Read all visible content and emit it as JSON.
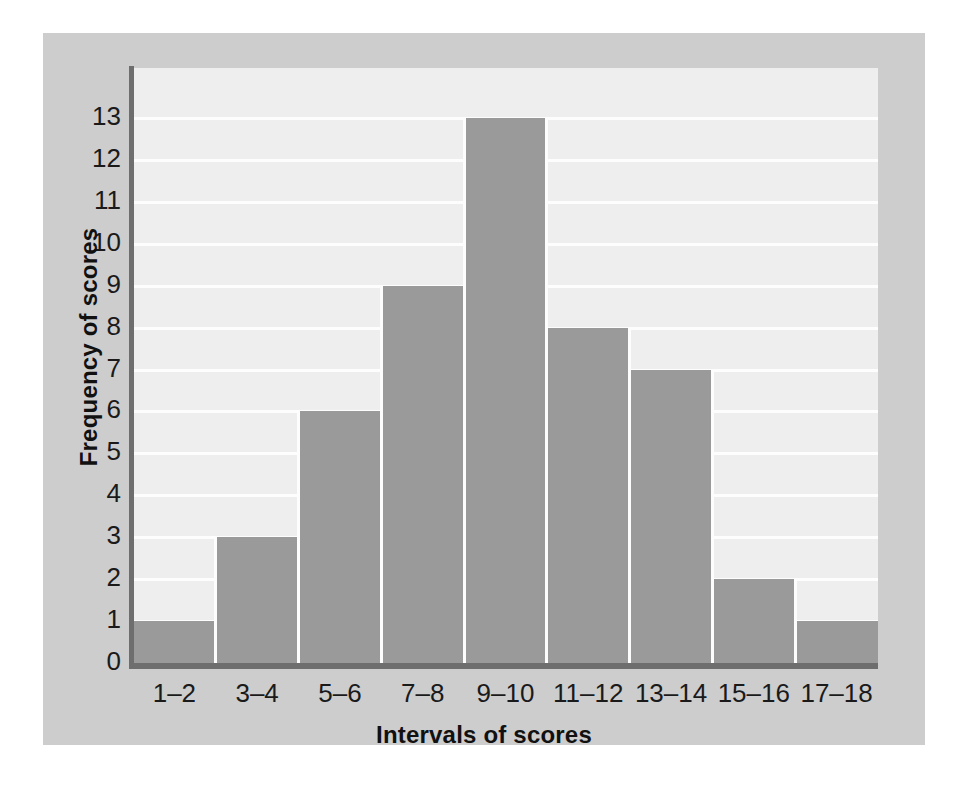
{
  "chart_data": {
    "type": "bar",
    "title": "",
    "subtitle": "",
    "xlabel": "Intervals of scores",
    "ylabel": "Frequency of scores",
    "categories": [
      "1–2",
      "3–4",
      "5–6",
      "7–8",
      "9–10",
      "11–12",
      "13–14",
      "15–16",
      "17–18"
    ],
    "values": [
      1,
      3,
      6,
      9,
      13,
      8,
      7,
      2,
      1
    ],
    "ylim": [
      0,
      13
    ],
    "yticks": [
      0,
      1,
      2,
      3,
      4,
      5,
      6,
      7,
      8,
      9,
      10,
      11,
      12,
      13
    ],
    "ytick_labels": [
      "0",
      "1",
      "2",
      "3",
      "4",
      "5",
      "6",
      "7",
      "8",
      "9",
      "10",
      "11",
      "12",
      "13"
    ],
    "grid": "horizontal",
    "legend": "none",
    "bar_gap": "adjacent-histogram",
    "colors": {
      "bar_fill": "#9a9a9a",
      "plot_background": "#eeeeee",
      "panel_background": "#cdcdcd",
      "gridline": "#fdfdfd",
      "axis_line": "#6e6e6e",
      "text": "#1a1a1a",
      "page_background": "#ffffff"
    }
  }
}
